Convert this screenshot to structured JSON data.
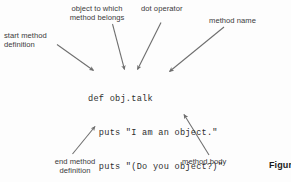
{
  "figure": {
    "background_color": "#fdfdfd",
    "text_color": "#3b3b3b",
    "code_color": "#2e2e2e",
    "arrow_color": "#6e6e6e",
    "caption_fragment": "Figur"
  },
  "code": {
    "language": "ruby",
    "lines": [
      "def obj.talk",
      "  puts \"I am an object.\"",
      "  puts \"(Do you object?)\"",
      "end"
    ],
    "line_1": "def obj.talk",
    "line_2": "  puts \"I am an object.\"",
    "line_3": "  puts \"(Do you object?)\"",
    "line_4": "end"
  },
  "annotations": [
    {
      "id": "start-method-definition",
      "text": "start method\ndefinition",
      "position": "top-left",
      "points_to": "def"
    },
    {
      "id": "object-to-which-method-belongs",
      "text": "object to which\nmethod belongs",
      "position": "top-center-left",
      "points_to": "obj"
    },
    {
      "id": "dot-operator",
      "text": "dot operator",
      "position": "top-center-right",
      "points_to": "."
    },
    {
      "id": "method-name",
      "text": "method name",
      "position": "top-right",
      "points_to": "talk"
    },
    {
      "id": "end-method-definition",
      "text": "end method\ndefinition",
      "position": "bottom-left",
      "points_to": "end"
    },
    {
      "id": "method-body",
      "text": "method body",
      "position": "bottom-right",
      "points_to": "puts lines"
    }
  ],
  "labels": {
    "start_method_definition": "start method\ndefinition",
    "object_to_which_method_belongs": "object to which\nmethod belongs",
    "dot_operator": "dot operator",
    "method_name": "method name",
    "end_method_definition": "end method\ndefinition",
    "method_body": "method body"
  }
}
